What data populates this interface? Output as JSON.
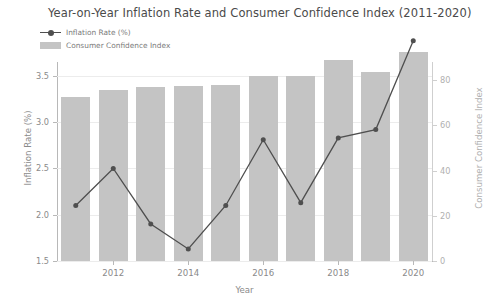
{
  "chart_data": {
    "type": "bar",
    "title": "Year-on-Year Inflation Rate and Consumer Confidence Index (2011-2020)",
    "xlabel": "Year",
    "ylabel": "Inflation Rate (%)",
    "y2label": "Consumer Confidence Index",
    "categories": [
      2011,
      2012,
      2013,
      2014,
      2015,
      2016,
      2017,
      2018,
      2019,
      2020
    ],
    "xtick_labels": [
      "2012",
      "2014",
      "2016",
      "2018",
      "2020"
    ],
    "xtick_values": [
      2012,
      2014,
      2016,
      2018,
      2020
    ],
    "xlim": [
      2010.5,
      2020.5
    ],
    "ylim": [
      1.5,
      3.65
    ],
    "y2lim": [
      0,
      88
    ],
    "ytick_labels": [
      "1.5",
      "2.0",
      "2.5",
      "3.0",
      "3.5"
    ],
    "ytick_values": [
      1.5,
      2.0,
      2.5,
      3.0,
      3.5
    ],
    "y2tick_labels": [
      "0",
      "20",
      "40",
      "60",
      "80"
    ],
    "y2tick_values": [
      0,
      20,
      40,
      60,
      80
    ],
    "grid": true,
    "legend_position": "upper left",
    "series": [
      {
        "name": "Inflation Rate (%)",
        "type": "line",
        "axis": "left",
        "color": "#4f4f4f",
        "marker": "circle",
        "values": [
          2.1,
          2.5,
          1.9,
          1.63,
          2.1,
          2.81,
          2.13,
          2.83,
          2.92,
          3.88
        ]
      },
      {
        "name": "Consumer Confidence Index",
        "type": "bar",
        "axis": "right",
        "color": "#c4c4c4",
        "values": [
          72.5,
          75.5,
          76.8,
          77.5,
          78.0,
          82.0,
          82.0,
          89.0,
          83.5,
          92.5
        ]
      }
    ]
  },
  "legend": {
    "items": [
      {
        "label": "Inflation Rate (%)",
        "marker": "line-marker"
      },
      {
        "label": "Consumer Confidence Index",
        "marker": "bar-swatch"
      }
    ]
  },
  "colors": {
    "bar": "#c4c4c4",
    "line": "#4f4f4f",
    "axis": "#b8b8b8",
    "grid": "#ececec",
    "text": "#8a8a8a",
    "title": "#4a4a4a",
    "right_axis_text": "#b0b0b0"
  }
}
